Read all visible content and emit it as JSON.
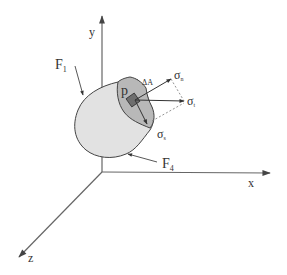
{
  "diagram": {
    "title": "",
    "axes": {
      "x": {
        "label": "x"
      },
      "y": {
        "label": "y"
      },
      "z": {
        "label": "z"
      }
    },
    "labels": {
      "force_1": {
        "base": "F",
        "sub": "1"
      },
      "force_4": {
        "base": "F",
        "sub": "4"
      },
      "point": "p",
      "area": "ΔA",
      "sigma_n": {
        "base": "σ",
        "sub": "n"
      },
      "sigma_t": {
        "base": "σ",
        "sub": "t"
      },
      "sigma_s": {
        "base": "σ",
        "sub": "s"
      }
    },
    "colors": {
      "body_fill": "#e2e2e2",
      "cut_face_fill": "#b8b8b8",
      "element_fill": "#6e6e6e",
      "line": "#444444",
      "axis": "#555555",
      "dashed": "#777777"
    }
  }
}
